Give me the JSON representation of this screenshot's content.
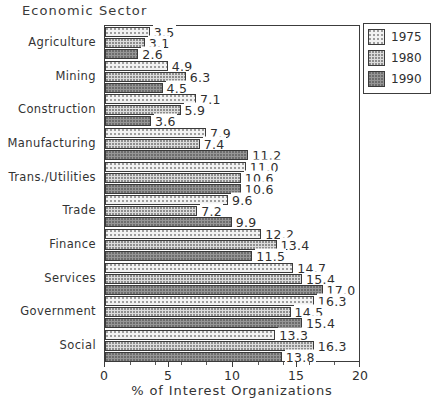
{
  "chart_data": {
    "type": "bar",
    "orientation": "horizontal",
    "title": "Economic Sector",
    "xlabel": "% of Interest Organizations",
    "ylabel": "",
    "xlim": [
      0,
      20
    ],
    "xticks": [
      0,
      5,
      10,
      15,
      20
    ],
    "xtick_labels": [
      "0",
      "5",
      "10",
      "15",
      "20"
    ],
    "grid": false,
    "legend_position": "upper right",
    "categories": [
      "Agriculture",
      "Mining",
      "Construction",
      "Manufacturing",
      "Trans./Utilities",
      "Trade",
      "Finance",
      "Services",
      "Government",
      "Social"
    ],
    "series": [
      {
        "name": "1975",
        "values": [
          3.5,
          4.9,
          7.1,
          7.9,
          11.0,
          9.6,
          12.2,
          14.7,
          16.3,
          13.3
        ]
      },
      {
        "name": "1980",
        "values": [
          3.1,
          6.3,
          5.9,
          7.4,
          10.6,
          7.2,
          13.4,
          15.4,
          14.5,
          16.3
        ]
      },
      {
        "name": "1990",
        "values": [
          2.6,
          4.5,
          3.6,
          11.2,
          10.6,
          9.9,
          11.5,
          17.0,
          15.4,
          13.8
        ]
      }
    ]
  },
  "legend": {
    "entries": [
      {
        "label": "1975",
        "swatch": "light-dotted"
      },
      {
        "label": "1980",
        "swatch": "medium-dotted"
      },
      {
        "label": "1990",
        "swatch": "dark-solid"
      }
    ]
  },
  "colors": {
    "series_1975": "#f2f2f2",
    "series_1980": "#dcdcdc",
    "series_1990": "#969696",
    "outline": "#3a3a3a",
    "text": "#2f2f2f",
    "background": "#ffffff"
  }
}
